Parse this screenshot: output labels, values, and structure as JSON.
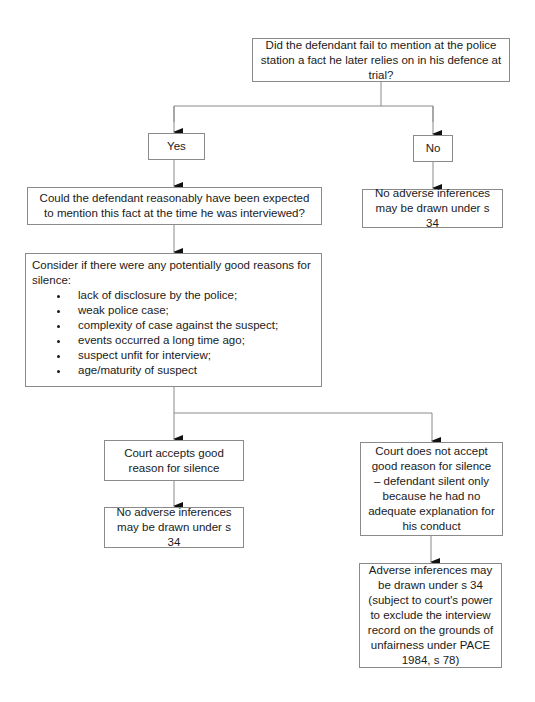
{
  "flowchart": {
    "start": "Did the defendant fail to mention at the police station a fact he later relies on in his defence at trial?",
    "yes": "Yes",
    "no": "No",
    "no_outcome": "No adverse inferences may be drawn under s 34",
    "question2": "Could the defendant reasonably have been expected to mention this fact at the time he was interviewed?",
    "consider": {
      "intro": "Consider if there were any potentially good reasons for silence:",
      "items": [
        "lack of disclosure by the police;",
        "weak police case;",
        "complexity of case against the suspect;",
        "events occurred a long time ago;",
        "suspect unfit for interview;",
        "age/maturity of suspect"
      ]
    },
    "accepts": "Court accepts good reason for silence",
    "accepts_outcome": "No adverse inferences may be drawn under s 34",
    "rejects": "Court does not accept good reason for silence – defendant silent only because he had no adequate explanation for his conduct",
    "rejects_outcome": "Adverse inferences may be drawn under s 34 (subject to court's power to exclude the interview record on the grounds of unfairness under PACE 1984, s 78)"
  },
  "colors": {
    "line": "#8a8a8a",
    "arrow": "#111111",
    "text": "#1a1a1a"
  }
}
